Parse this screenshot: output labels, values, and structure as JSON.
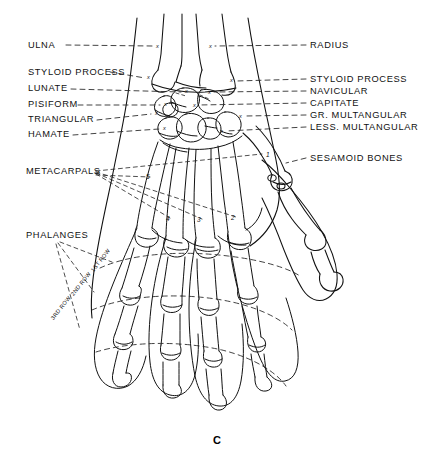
{
  "figure": {
    "caption": "C"
  },
  "labels_left": [
    {
      "text": "ULNA",
      "x": 28,
      "y": 46,
      "lead_to_x": 158,
      "lead_to_y": 49
    },
    {
      "text": "STYLOID PROCESS",
      "x": 28,
      "y": 73,
      "lead_to_x": 152,
      "lead_to_y": 81
    },
    {
      "text": "LUNATE",
      "x": 28,
      "y": 90,
      "lead_to_x": 186,
      "lead_to_y": 95
    },
    {
      "text": "PISIFORM",
      "x": 28,
      "y": 106,
      "lead_to_x": 166,
      "lead_to_y": 108
    },
    {
      "text": "TRIANGULAR",
      "x": 28,
      "y": 121,
      "lead_to_x": 157,
      "lead_to_y": 117
    },
    {
      "text": "HAMATE",
      "x": 28,
      "y": 136,
      "lead_to_x": 165,
      "lead_to_y": 131
    }
  ],
  "labels_right": [
    {
      "text": "RADIUS",
      "x": 310,
      "y": 46,
      "lead_to_x": 212,
      "lead_to_y": 49
    },
    {
      "text": "STYLOID PROCESS",
      "x": 310,
      "y": 80,
      "lead_to_x": 232,
      "lead_to_y": 83
    },
    {
      "text": "NAVICULAR",
      "x": 310,
      "y": 92,
      "lead_to_x": 209,
      "lead_to_y": 95
    },
    {
      "text": "CAPITATE",
      "x": 310,
      "y": 104,
      "lead_to_x": 195,
      "lead_to_y": 108
    },
    {
      "text": "GR. MULTANGULAR",
      "x": 310,
      "y": 116,
      "lead_to_x": 240,
      "lead_to_y": 119
    },
    {
      "text": "LESS. MULTANGULAR",
      "x": 310,
      "y": 128,
      "lead_to_x": 222,
      "lead_to_y": 134
    },
    {
      "text": "SESAMOID BONES",
      "x": 310,
      "y": 159,
      "lead_to_x": 282,
      "lead_to_y": 167
    }
  ],
  "labels_other": [
    {
      "text": "METACARPALS",
      "x": 26,
      "y": 172
    },
    {
      "text": "PHALANGES",
      "x": 26,
      "y": 236
    }
  ],
  "row_labels": [
    {
      "text": "1ST ROW",
      "x": 92,
      "y": 268,
      "rotate": -52
    },
    {
      "text": "2ND ROW",
      "x": 72,
      "y": 292,
      "rotate": -52
    },
    {
      "text": "3RD ROW",
      "x": 52,
      "y": 316,
      "rotate": -52
    }
  ],
  "metacarpal_numbers": [
    {
      "text": "1",
      "x": 266,
      "y": 157
    },
    {
      "text": "2",
      "x": 231,
      "y": 219
    },
    {
      "text": "3",
      "x": 197,
      "y": 221
    },
    {
      "text": "4",
      "x": 166,
      "y": 220
    },
    {
      "text": "5",
      "x": 146,
      "y": 178
    }
  ],
  "x_markers": [
    {
      "x": 156,
      "y": 47
    },
    {
      "x": 209,
      "y": 47
    },
    {
      "x": 147,
      "y": 78
    },
    {
      "x": 230,
      "y": 81
    },
    {
      "x": 185,
      "y": 92
    },
    {
      "x": 208,
      "y": 93
    },
    {
      "x": 164,
      "y": 105
    },
    {
      "x": 193,
      "y": 106
    },
    {
      "x": 155,
      "y": 114
    },
    {
      "x": 239,
      "y": 117
    },
    {
      "x": 163,
      "y": 129
    },
    {
      "x": 220,
      "y": 132
    }
  ],
  "colors": {
    "ink": "#111111",
    "background": "#ffffff",
    "dash": "#222222"
  }
}
